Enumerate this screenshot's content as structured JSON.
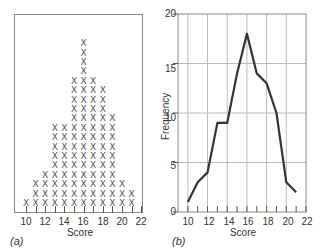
{
  "chart_data": [
    {
      "type": "dotplot",
      "panel_label": "(a)",
      "title": "",
      "xlabel": "Score",
      "ylabel": "",
      "x_ticks": [
        10,
        12,
        14,
        16,
        18,
        20,
        22
      ],
      "xlim": [
        9,
        22
      ],
      "marker": "X",
      "categories": [
        10,
        11,
        12,
        13,
        14,
        15,
        16,
        17,
        18,
        19,
        20,
        21
      ],
      "values": [
        1,
        3,
        4,
        9,
        9,
        14,
        18,
        14,
        13,
        10,
        3,
        2
      ],
      "grid": false
    },
    {
      "type": "line",
      "panel_label": "(b)",
      "title": "",
      "xlabel": "Score",
      "ylabel": "Frequency",
      "x_ticks": [
        10,
        12,
        14,
        16,
        18,
        20,
        22
      ],
      "y_ticks": [
        0,
        5,
        10,
        15,
        20
      ],
      "xlim": [
        9,
        22
      ],
      "ylim": [
        0,
        20
      ],
      "x": [
        10,
        11,
        12,
        13,
        14,
        15,
        16,
        17,
        18,
        19,
        20,
        21
      ],
      "series": [
        {
          "name": "Frequency",
          "values": [
            1,
            3,
            4,
            9,
            9,
            14,
            18,
            14,
            13,
            10,
            3,
            2
          ]
        }
      ],
      "grid": true
    }
  ],
  "labels": {
    "a_panel": "(a)",
    "b_panel": "(b)",
    "a_xlabel": "Score",
    "b_xlabel": "Score",
    "b_ylabel": "Frequency",
    "x_ticks": [
      "10",
      "12",
      "14",
      "16",
      "18",
      "20",
      "22"
    ],
    "y_ticks": [
      "0",
      "5",
      "10",
      "15",
      "20"
    ]
  },
  "colors": {
    "line": "#333333",
    "grid": "#bbbbbb",
    "frame": "#888888",
    "marker": "#555555"
  }
}
